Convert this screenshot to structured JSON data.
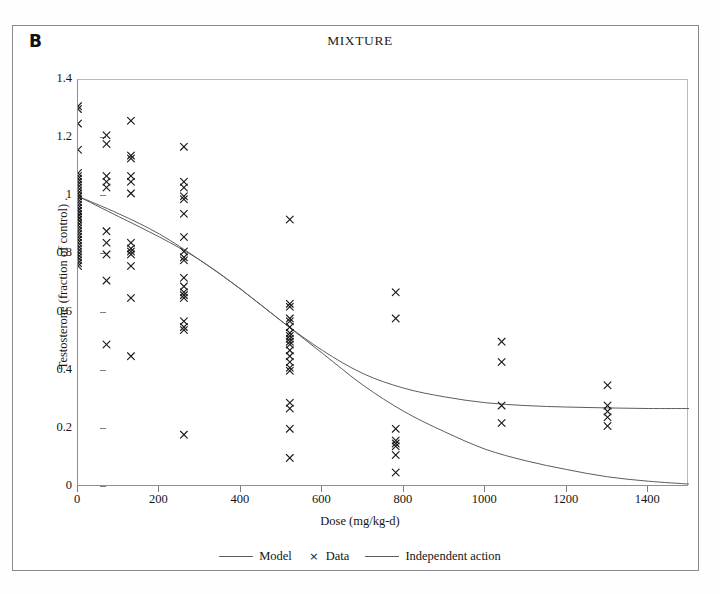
{
  "figure": {
    "panel_label": "B",
    "title": "MIXTURE",
    "background_color": "#ffffff",
    "border_color": "#8a8a8a"
  },
  "legend": {
    "position": "bottom-center",
    "items": [
      {
        "label": "Model",
        "glyph": "line",
        "color": "#5d5d5d"
      },
      {
        "label": "Data",
        "glyph": "×",
        "color": "#1a1a1a"
      },
      {
        "label": "Independent action",
        "glyph": "line",
        "color": "#5d5d5d"
      }
    ]
  },
  "chart_data": {
    "type": "scatter",
    "title": "MIXTURE",
    "subtitle": "",
    "xlabel": "Dose (mg/kg-d)",
    "ylabel": "Testosterone (fraction of control) .",
    "xlim": [
      0,
      1500
    ],
    "ylim": [
      0,
      1.4
    ],
    "xticks": [
      0,
      200,
      400,
      600,
      800,
      1000,
      1200,
      1400
    ],
    "yticks": [
      0,
      0.2,
      0.4,
      0.6,
      0.8,
      1,
      1.2,
      1.4
    ],
    "xtick_labels": [
      "0",
      "200",
      "400",
      "600",
      "800",
      "1000",
      "1200",
      "1400"
    ],
    "ytick_labels": [
      "0",
      "0.2",
      "0.4",
      "0.6",
      "0.8",
      "1",
      "1.2",
      "1.4"
    ],
    "grid": false,
    "legend_position": "below-axes",
    "series": [
      {
        "name": "Data",
        "type": "scatter",
        "marker": "x",
        "color": "#1a1a1a",
        "points": [
          [
            0,
            1.31
          ],
          [
            0,
            1.3
          ],
          [
            0,
            1.25
          ],
          [
            0,
            1.16
          ],
          [
            0,
            1.08
          ],
          [
            0,
            1.07
          ],
          [
            0,
            1.06
          ],
          [
            0,
            1.05
          ],
          [
            0,
            1.04
          ],
          [
            0,
            1.03
          ],
          [
            0,
            1.02
          ],
          [
            0,
            1.01
          ],
          [
            0,
            1.0
          ],
          [
            0,
            1.0
          ],
          [
            0,
            0.99
          ],
          [
            0,
            0.98
          ],
          [
            0,
            0.97
          ],
          [
            0,
            0.96
          ],
          [
            0,
            0.95
          ],
          [
            0,
            0.95
          ],
          [
            0,
            0.94
          ],
          [
            0,
            0.93
          ],
          [
            0,
            0.93
          ],
          [
            0,
            0.92
          ],
          [
            0,
            0.92
          ],
          [
            0,
            0.91
          ],
          [
            0,
            0.9
          ],
          [
            0,
            0.89
          ],
          [
            0,
            0.88
          ],
          [
            0,
            0.87
          ],
          [
            0,
            0.86
          ],
          [
            0,
            0.85
          ],
          [
            0,
            0.84
          ],
          [
            0,
            0.83
          ],
          [
            0,
            0.82
          ],
          [
            0,
            0.81
          ],
          [
            0,
            0.8
          ],
          [
            0,
            0.79
          ],
          [
            0,
            0.78
          ],
          [
            0,
            0.77
          ],
          [
            0,
            0.76
          ],
          [
            70,
            1.21
          ],
          [
            70,
            1.18
          ],
          [
            70,
            1.07
          ],
          [
            70,
            1.05
          ],
          [
            70,
            1.03
          ],
          [
            70,
            0.88
          ],
          [
            70,
            0.84
          ],
          [
            70,
            0.8
          ],
          [
            70,
            0.71
          ],
          [
            70,
            0.49
          ],
          [
            130,
            1.26
          ],
          [
            130,
            1.14
          ],
          [
            130,
            1.13
          ],
          [
            130,
            1.07
          ],
          [
            130,
            1.05
          ],
          [
            130,
            1.01
          ],
          [
            130,
            0.84
          ],
          [
            130,
            0.82
          ],
          [
            130,
            0.81
          ],
          [
            130,
            0.8
          ],
          [
            130,
            0.76
          ],
          [
            130,
            0.65
          ],
          [
            130,
            0.45
          ],
          [
            260,
            1.17
          ],
          [
            260,
            1.05
          ],
          [
            260,
            1.03
          ],
          [
            260,
            1.0
          ],
          [
            260,
            0.99
          ],
          [
            260,
            0.94
          ],
          [
            260,
            0.86
          ],
          [
            260,
            0.81
          ],
          [
            260,
            0.79
          ],
          [
            260,
            0.78
          ],
          [
            260,
            0.72
          ],
          [
            260,
            0.69
          ],
          [
            260,
            0.67
          ],
          [
            260,
            0.66
          ],
          [
            260,
            0.65
          ],
          [
            260,
            0.57
          ],
          [
            260,
            0.55
          ],
          [
            260,
            0.54
          ],
          [
            260,
            0.18
          ],
          [
            520,
            0.92
          ],
          [
            520,
            0.63
          ],
          [
            520,
            0.62
          ],
          [
            520,
            0.58
          ],
          [
            520,
            0.57
          ],
          [
            520,
            0.55
          ],
          [
            520,
            0.53
          ],
          [
            520,
            0.52
          ],
          [
            520,
            0.51
          ],
          [
            520,
            0.5
          ],
          [
            520,
            0.49
          ],
          [
            520,
            0.47
          ],
          [
            520,
            0.45
          ],
          [
            520,
            0.43
          ],
          [
            520,
            0.41
          ],
          [
            520,
            0.4
          ],
          [
            520,
            0.29
          ],
          [
            520,
            0.27
          ],
          [
            520,
            0.2
          ],
          [
            520,
            0.1
          ],
          [
            780,
            0.67
          ],
          [
            780,
            0.58
          ],
          [
            780,
            0.2
          ],
          [
            780,
            0.16
          ],
          [
            780,
            0.15
          ],
          [
            780,
            0.14
          ],
          [
            780,
            0.11
          ],
          [
            780,
            0.05
          ],
          [
            1040,
            0.5
          ],
          [
            1040,
            0.43
          ],
          [
            1040,
            0.28
          ],
          [
            1040,
            0.22
          ],
          [
            1300,
            0.35
          ],
          [
            1300,
            0.28
          ],
          [
            1300,
            0.26
          ],
          [
            1300,
            0.24
          ],
          [
            1300,
            0.21
          ]
        ]
      },
      {
        "name": "Model",
        "type": "line",
        "color": "#5d5d5d",
        "description": "Fitted mixture model; declines from 1.0 and plateaus near 0.27",
        "x": [
          0,
          100,
          200,
          300,
          400,
          500,
          600,
          700,
          800,
          900,
          1000,
          1100,
          1200,
          1300,
          1400,
          1500
        ],
        "y": [
          1.0,
          0.94,
          0.87,
          0.78,
          0.68,
          0.57,
          0.47,
          0.39,
          0.34,
          0.31,
          0.29,
          0.28,
          0.275,
          0.272,
          0.27,
          0.27
        ]
      },
      {
        "name": "Independent action",
        "type": "line",
        "color": "#5d5d5d",
        "description": "Independent action prediction; decays toward zero",
        "x": [
          0,
          100,
          200,
          300,
          400,
          500,
          600,
          700,
          800,
          900,
          1000,
          1100,
          1200,
          1300,
          1400,
          1500
        ],
        "y": [
          1.0,
          0.93,
          0.86,
          0.78,
          0.68,
          0.57,
          0.46,
          0.35,
          0.26,
          0.19,
          0.13,
          0.09,
          0.06,
          0.035,
          0.02,
          0.01
        ]
      }
    ]
  }
}
